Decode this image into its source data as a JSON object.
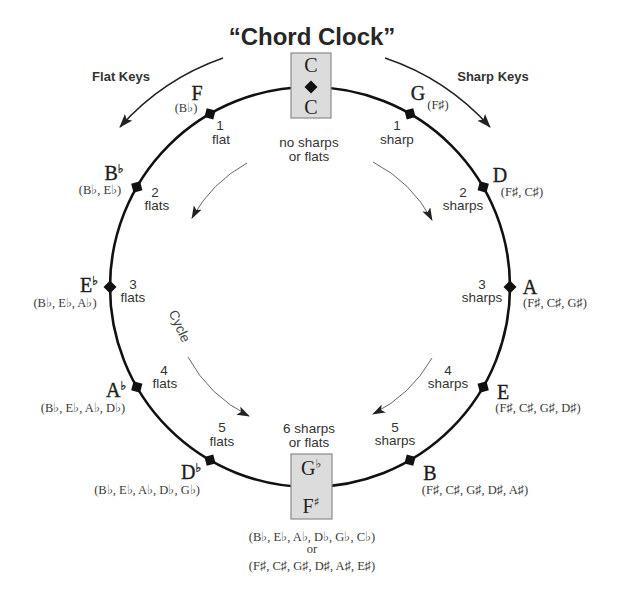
{
  "title": "“Chord Clock”",
  "directions": {
    "flat_keys": "Flat Keys",
    "sharp_keys": "Sharp Keys",
    "cycle": "Cycle"
  },
  "colors": {
    "circle": "#111111",
    "box_fill": "#dcdcdc",
    "text": "#333333"
  },
  "top_box": {
    "upper": "C",
    "lower": "C",
    "count_line1": "no sharps",
    "count_line2": "or flats"
  },
  "bottom_box": {
    "upper_letter": "G",
    "upper_accidental": "♭",
    "lower_letter": "F",
    "lower_accidental": "♯",
    "count_line1": "6 sharps",
    "count_line2": "or flats",
    "flat_signature": "(B♭, E♭, A♭, D♭, G♭, C♭)",
    "or_label": "or",
    "sharp_signature": "(F♯, C♯, G♯, D♯, A♯, E♯)"
  },
  "sharp_keys": [
    {
      "letter": "G",
      "accidental": "",
      "signature": "(F♯)",
      "count": "1",
      "unit": "sharp"
    },
    {
      "letter": "D",
      "accidental": "",
      "signature": "(F♯, C♯)",
      "count": "2",
      "unit": "sharps"
    },
    {
      "letter": "A",
      "accidental": "",
      "signature": "(F♯, C♯, G♯)",
      "count": "3",
      "unit": "sharps"
    },
    {
      "letter": "E",
      "accidental": "",
      "signature": "(F♯, C♯, G♯, D♯)",
      "count": "4",
      "unit": "sharps"
    },
    {
      "letter": "B",
      "accidental": "",
      "signature": "(F♯, C♯, G♯, D♯, A♯)",
      "count": "5",
      "unit": "sharps"
    }
  ],
  "flat_keys": [
    {
      "letter": "F",
      "accidental": "",
      "signature": "(B♭)",
      "count": "1",
      "unit": "flat"
    },
    {
      "letter": "B",
      "accidental": "♭",
      "signature": "(B♭, E♭)",
      "count": "2",
      "unit": "flats"
    },
    {
      "letter": "E",
      "accidental": "♭",
      "signature": "(B♭, E♭, A♭)",
      "count": "3",
      "unit": "flats"
    },
    {
      "letter": "A",
      "accidental": "♭",
      "signature": "(B♭, E♭, A♭, D♭)",
      "count": "4",
      "unit": "flats"
    },
    {
      "letter": "D",
      "accidental": "♭",
      "signature": "(B♭, E♭, A♭, D♭, G♭)",
      "count": "5",
      "unit": "flats"
    }
  ]
}
